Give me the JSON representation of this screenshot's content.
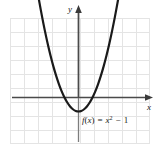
{
  "figure": {
    "name": "parabola-graph",
    "background_color": "#ffffff",
    "function_label": "f(x) = x² − 1",
    "function_label_parts": {
      "f": "f",
      "open_paren": "(",
      "x_arg": "x",
      "close_paren": ")",
      "equals": "=",
      "x_base": "x",
      "exponent": "2",
      "minus": "−",
      "constant": "1"
    },
    "axes": {
      "x_label": "x",
      "y_label": "y",
      "axis_color": "#444444",
      "arrow_x": "right",
      "arrow_y": "up"
    },
    "grid": {
      "color": "#e2e2e2",
      "cell_size": 14,
      "columns": 10,
      "rows": 9,
      "visible": true
    },
    "curve": {
      "color": "#1a1a1a",
      "width": 2.2
    }
  },
  "chart_data": {
    "type": "line",
    "title": "",
    "subtitle": "",
    "xlabel": "x",
    "ylabel": "y",
    "legend": [
      "f(x) = x² − 1"
    ],
    "legend_position": "inline-below-vertex",
    "grid": true,
    "xlim": [
      -5,
      5
    ],
    "ylim": [
      -2,
      7
    ],
    "x_ticks": [
      -5,
      -4,
      -3,
      -2,
      -1,
      0,
      1,
      2,
      3,
      4,
      5
    ],
    "y_ticks": [
      -2,
      -1,
      0,
      1,
      2,
      3,
      4,
      5,
      6,
      7
    ],
    "tick_labels_shown": false,
    "series": [
      {
        "name": "f(x) = x² − 1",
        "equation": "y = x^2 - 1",
        "vertex": [
          0,
          -1
        ],
        "roots": [
          -1,
          1
        ],
        "y_intercept": -1,
        "x": [
          -2.83,
          -2.6,
          -2.4,
          -2.2,
          -2.0,
          -1.8,
          -1.6,
          -1.4,
          -1.2,
          -1.0,
          -0.8,
          -0.6,
          -0.4,
          -0.2,
          0,
          0.2,
          0.4,
          0.6,
          0.8,
          1.0,
          1.2,
          1.4,
          1.6,
          1.8,
          2.0,
          2.2,
          2.4,
          2.6,
          2.83
        ],
        "y": [
          7.0,
          5.76,
          4.76,
          3.84,
          3.0,
          2.24,
          1.56,
          0.96,
          0.44,
          0,
          -0.36,
          -0.64,
          -0.84,
          -0.96,
          -1.0,
          -0.96,
          -0.84,
          -0.64,
          -0.36,
          0,
          0.44,
          0.96,
          1.56,
          2.24,
          3.0,
          3.84,
          4.76,
          5.76,
          7.0
        ]
      }
    ]
  }
}
